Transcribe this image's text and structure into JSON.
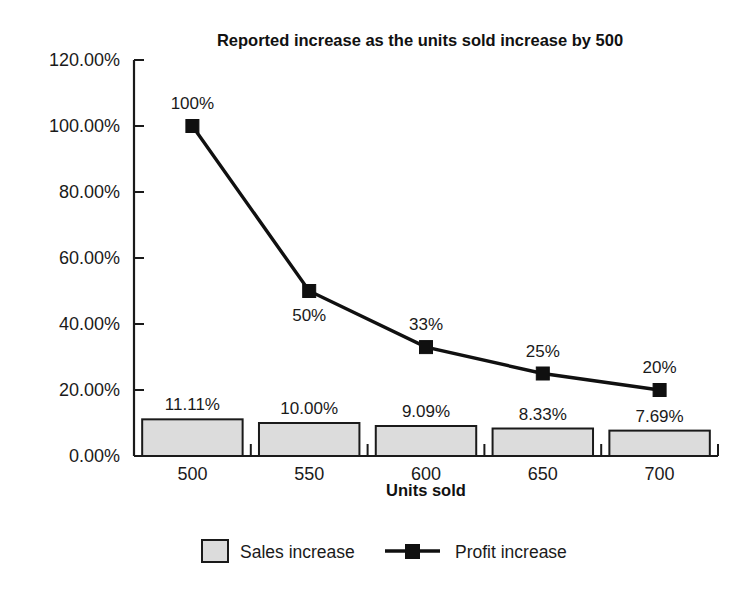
{
  "chart_data": {
    "type": "bar",
    "title": "Reported increase as the units sold increase by 500",
    "xlabel": "Units sold",
    "ylabel": "",
    "categories": [
      "500",
      "550",
      "600",
      "650",
      "700"
    ],
    "ylim": [
      0,
      120
    ],
    "ytick_labels": [
      "120.00%",
      "100.00%",
      "80.00%",
      "60.00%",
      "40.00%",
      "20.00%",
      "0.00%"
    ],
    "ytick_values": [
      120,
      100,
      80,
      60,
      40,
      20,
      0
    ],
    "grid": false,
    "legend_position": "bottom",
    "series": [
      {
        "name": "Sales increase",
        "render": "bar",
        "color": "#dcdcdc",
        "values": [
          11.11,
          10.0,
          9.09,
          8.33,
          7.69
        ],
        "labels": [
          "11.11%",
          "10.00%",
          "9.09%",
          "8.33%",
          "7.69%"
        ]
      },
      {
        "name": "Profit increase",
        "render": "line",
        "color": "#101010",
        "values": [
          100,
          50,
          33,
          25,
          20
        ],
        "labels": [
          "100%",
          "50%",
          "33%",
          "25%",
          "20%"
        ],
        "label_positions": [
          "above",
          "below",
          "above",
          "above",
          "above"
        ]
      }
    ]
  },
  "legend": {
    "items": [
      {
        "label": "Sales increase",
        "marker": "filled-square-swatch"
      },
      {
        "label": "Profit increase",
        "marker": "line-with-square-marker"
      }
    ]
  }
}
